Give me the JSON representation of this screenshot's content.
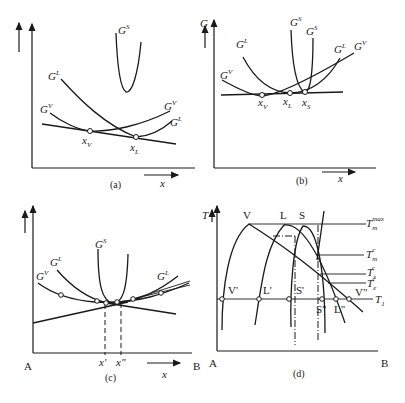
{
  "figure": {
    "panels": [
      {
        "id": "a",
        "caption": "(a)",
        "y_axis_label": "",
        "x_axis_label": "x",
        "curve_labels": {
          "GS": "G",
          "GS_sup": "S",
          "GL_left": "G",
          "GL_left_sup": "L",
          "GV_left": "G",
          "GV_left_sup": "V",
          "GV_right": "G",
          "GV_right_sup": "V",
          "GL_right": "G",
          "GL_right_sup": "L"
        },
        "points": {
          "xV": "x",
          "xV_sub": "V",
          "xL": "x",
          "xL_sub": "L"
        }
      },
      {
        "id": "b",
        "caption": "(b)",
        "y_axis_label": "G",
        "x_axis_label": "x",
        "curve_labels": {
          "GV_left": "G",
          "GV_left_sup": "V",
          "GL_left": "G",
          "GL_left_sup": "L",
          "GS_left": "G",
          "GS_left_sup": "S",
          "GS_right": "G",
          "GS_right_sup": "S",
          "GL_right": "G",
          "GL_right_sup": "L",
          "GV_right": "G",
          "GV_right_sup": "V"
        },
        "points": {
          "xV": "x",
          "xV_sub": "V",
          "xL": "x",
          "xL_sub": "L",
          "xS": "x",
          "xS_sub": "S"
        }
      },
      {
        "id": "c",
        "caption": "(c)",
        "x_axis_label": "x",
        "endpoints": {
          "left": "A",
          "right": "B"
        },
        "curve_labels": {
          "GV": "G",
          "GV_sup": "V",
          "GL_left": "G",
          "GL_left_sup": "L",
          "GS": "G",
          "GS_sup": "S",
          "GL_right": "G",
          "GL_right_sup": "L"
        },
        "points": {
          "x1": "x'",
          "x2": "x\""
        }
      },
      {
        "id": "d",
        "caption": "(d)",
        "y_axis_label": "T",
        "endpoints": {
          "left": "A",
          "right": "B"
        },
        "peak_labels": {
          "V": "V",
          "L": "L",
          "S": "S"
        },
        "intersection_labels": {
          "V1": "V'",
          "L1": "L'",
          "S1": "S'",
          "S2": "S\"",
          "L2": "L\"",
          "V2": "V\""
        },
        "temperature_labels": {
          "Tm_max": "T",
          "Tm_max_sub": "m",
          "Tm_max_sup": "max",
          "Tm_c": "T",
          "Tm_c_sub": "m",
          "Tm_c_sup": "c",
          "Ts_c": "T",
          "Ts_c_sub": "s",
          "Ts_c_sup": "c",
          "Te_c": "T",
          "Te_c_sub": "e",
          "Te_c_sup": "c",
          "T1": "T",
          "T1_sub": "1"
        }
      }
    ]
  }
}
